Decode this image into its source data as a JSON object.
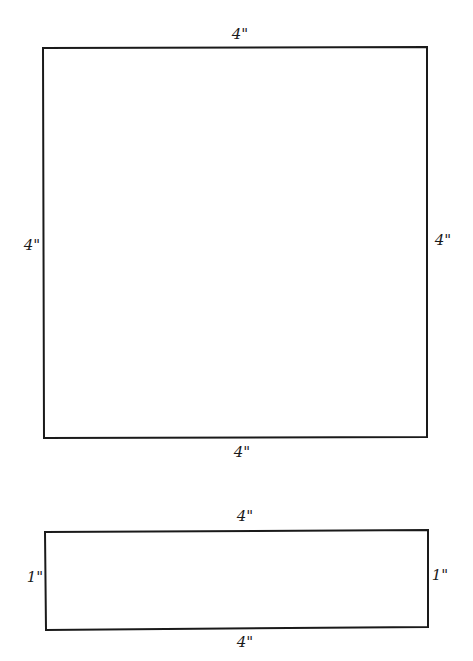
{
  "diagram": {
    "stroke_color": "#1a1a1a",
    "background": "#ffffff",
    "shapes": [
      {
        "name": "square",
        "rect": {
          "x": 43,
          "y": 48,
          "width": 384,
          "height": 390
        },
        "labels": {
          "top": "4\"",
          "left": "4\"",
          "right": "4\"",
          "bottom": "4\""
        }
      },
      {
        "name": "rectangle",
        "rect": {
          "x": 45,
          "y": 530,
          "width": 383,
          "height": 100
        },
        "labels": {
          "top": "4\"",
          "left": "1\"",
          "right": "1\"",
          "bottom": "4\""
        }
      }
    ]
  }
}
